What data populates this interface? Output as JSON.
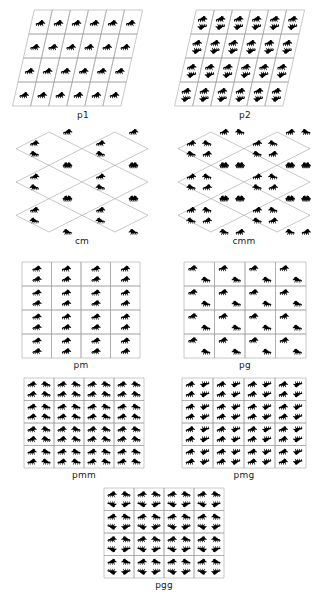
{
  "figure": {
    "title_visible": false,
    "background_color": "#ffffff",
    "motif_color": "#000000",
    "lattice_color": "#9a9a9a",
    "motif_name": "animal-silhouette",
    "panel_count": 9
  },
  "panels": [
    {
      "id": "p1",
      "label": "p1",
      "lattice": "oblique",
      "cells_x": 6,
      "cells_y": 4,
      "motifs_per_cell": 1,
      "symmetry": "translation only",
      "x": 18,
      "y": 10,
      "w": 130,
      "h": 96,
      "label_x": 18,
      "label_y": 110,
      "label_w": 130
    },
    {
      "id": "p2",
      "label": "p2",
      "lattice": "oblique",
      "cells_x": 6,
      "cells_y": 4,
      "motifs_per_cell": 2,
      "symmetry": "2-fold rotation",
      "x": 180,
      "y": 10,
      "w": 130,
      "h": 96,
      "label_x": 180,
      "label_y": 110,
      "label_w": 130
    },
    {
      "id": "cm",
      "label": "cm",
      "lattice": "rhombic",
      "cells_x": 2,
      "cells_y": 3,
      "motifs_per_cell": 2,
      "symmetry": "mirror + glide",
      "x": 16,
      "y": 132,
      "w": 132,
      "h": 100,
      "label_x": 16,
      "label_y": 236,
      "label_w": 132
    },
    {
      "id": "cmm",
      "label": "cmm",
      "lattice": "rhombic",
      "cells_x": 2,
      "cells_y": 3,
      "motifs_per_cell": 4,
      "symmetry": "two mirrors + 2-fold rotation",
      "x": 178,
      "y": 132,
      "w": 132,
      "h": 100,
      "label_x": 178,
      "label_y": 236,
      "label_w": 132
    },
    {
      "id": "pm",
      "label": "pm",
      "lattice": "rectangular",
      "cells_x": 4,
      "cells_y": 4,
      "motifs_per_cell": 2,
      "symmetry": "mirror reflection",
      "x": 22,
      "y": 262,
      "w": 118,
      "h": 96,
      "label_x": 22,
      "label_y": 360,
      "label_w": 118
    },
    {
      "id": "pg",
      "label": "pg",
      "lattice": "rectangular",
      "cells_x": 4,
      "cells_y": 4,
      "motifs_per_cell": 2,
      "symmetry": "glide reflection",
      "x": 184,
      "y": 262,
      "w": 122,
      "h": 96,
      "label_x": 184,
      "label_y": 360,
      "label_w": 122
    },
    {
      "id": "pmm",
      "label": "pmm",
      "lattice": "rectangular",
      "cells_x": 4,
      "cells_y": 4,
      "motifs_per_cell": 4,
      "symmetry": "two perpendicular mirrors",
      "x": 24,
      "y": 378,
      "w": 120,
      "h": 90,
      "label_x": 24,
      "label_y": 470,
      "label_w": 120
    },
    {
      "id": "pmg",
      "label": "pmg",
      "lattice": "rectangular",
      "cells_x": 4,
      "cells_y": 4,
      "motifs_per_cell": 4,
      "symmetry": "mirror + glide + 2-fold rotation",
      "x": 182,
      "y": 378,
      "w": 124,
      "h": 90,
      "label_x": 182,
      "label_y": 470,
      "label_w": 124
    },
    {
      "id": "pgg",
      "label": "pgg",
      "lattice": "rectangular",
      "cells_x": 4,
      "cells_y": 4,
      "motifs_per_cell": 4,
      "symmetry": "two glides + 2-fold rotation",
      "x": 104,
      "y": 488,
      "w": 120,
      "h": 90,
      "label_x": 104,
      "label_y": 580,
      "label_w": 120
    }
  ]
}
